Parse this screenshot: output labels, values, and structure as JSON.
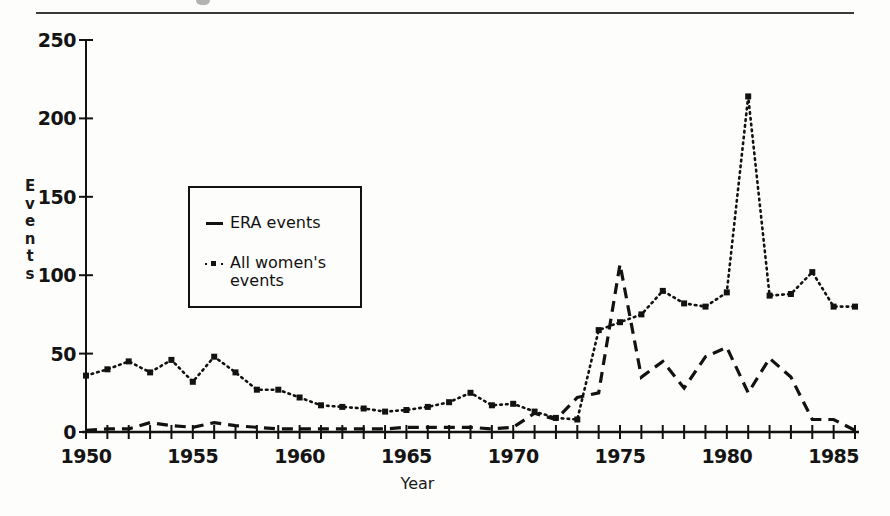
{
  "page": {
    "background_color": "#fdfdfb",
    "ink_color": "#121212",
    "top_rule": "horizontal-rule"
  },
  "axis": {
    "y_ticks": [
      "0",
      "50",
      "100",
      "150",
      "200",
      "250"
    ],
    "x_ticks": [
      "1950",
      "1955",
      "1960",
      "1965",
      "1970",
      "1975",
      "1980",
      "1985"
    ],
    "y_title_letters": [
      "E",
      "v",
      "e",
      "n",
      "t",
      "s"
    ],
    "x_title": "Year"
  },
  "legend": {
    "items": [
      {
        "label": "ERA events",
        "marker": "solid-dash-line"
      },
      {
        "label": "All women's\nevents",
        "marker": "dotted-square-line"
      }
    ]
  },
  "chart_data": {
    "type": "line",
    "title": "",
    "xlabel": "Year",
    "ylabel": "Events",
    "xlim": [
      1950,
      1986
    ],
    "ylim": [
      0,
      250
    ],
    "grid": false,
    "legend_position": "inside-left",
    "x": [
      1950,
      1951,
      1952,
      1953,
      1954,
      1955,
      1956,
      1957,
      1958,
      1959,
      1960,
      1961,
      1962,
      1963,
      1964,
      1965,
      1966,
      1967,
      1968,
      1969,
      1970,
      1971,
      1972,
      1973,
      1974,
      1975,
      1976,
      1977,
      1978,
      1979,
      1980,
      1981,
      1982,
      1983,
      1984,
      1985,
      1986
    ],
    "series": [
      {
        "name": "ERA events",
        "style": "dashed",
        "values": [
          1,
          2,
          2,
          6,
          4,
          3,
          6,
          4,
          3,
          2,
          2,
          2,
          2,
          2,
          2,
          3,
          3,
          3,
          3,
          2,
          3,
          12,
          8,
          22,
          25,
          107,
          35,
          45,
          28,
          48,
          54,
          25,
          47,
          35,
          8,
          8,
          1
        ]
      },
      {
        "name": "All women's events",
        "style": "dotted",
        "marker": "square",
        "values": [
          36,
          41,
          45,
          38,
          46,
          32,
          48,
          38,
          27,
          27,
          22,
          17,
          16,
          15,
          13,
          14,
          16,
          19,
          25,
          17,
          18,
          13,
          9,
          8,
          65,
          70,
          75,
          90,
          82,
          80,
          89,
          214,
          87,
          88,
          102,
          80,
          80
        ]
      }
    ],
    "series_note": "values read off the plot; 'All women's events' peaks at 214 in 1975 and 'ERA events' peaks at 107 in 1975"
  },
  "chart_points": {
    "era": [
      [
        1950,
        1
      ],
      [
        1951,
        2
      ],
      [
        1952,
        2
      ],
      [
        1953,
        6
      ],
      [
        1954,
        4
      ],
      [
        1955,
        3
      ],
      [
        1956,
        6
      ],
      [
        1957,
        4
      ],
      [
        1958,
        3
      ],
      [
        1959,
        2
      ],
      [
        1960,
        2
      ],
      [
        1961,
        2
      ],
      [
        1962,
        2
      ],
      [
        1963,
        2
      ],
      [
        1964,
        2
      ],
      [
        1965,
        3
      ],
      [
        1966,
        3
      ],
      [
        1967,
        3
      ],
      [
        1968,
        3
      ],
      [
        1969,
        2
      ],
      [
        1970,
        3
      ],
      [
        1971,
        12
      ],
      [
        1972,
        8
      ],
      [
        1973,
        22
      ],
      [
        1974,
        25
      ],
      [
        1975,
        107
      ],
      [
        1976,
        35
      ],
      [
        1977,
        45
      ],
      [
        1978,
        28
      ],
      [
        1979,
        48
      ],
      [
        1980,
        54
      ],
      [
        1981,
        25
      ],
      [
        1982,
        47
      ],
      [
        1983,
        35
      ],
      [
        1984,
        8
      ],
      [
        1985,
        8
      ],
      [
        1986,
        1
      ]
    ],
    "allwomen": [
      [
        1950,
        36
      ],
      [
        1951,
        40
      ],
      [
        1952,
        45
      ],
      [
        1953,
        38
      ],
      [
        1954,
        46
      ],
      [
        1955,
        32
      ],
      [
        1956,
        48
      ],
      [
        1957,
        38
      ],
      [
        1958,
        27
      ],
      [
        1959,
        27
      ],
      [
        1960,
        22
      ],
      [
        1961,
        17
      ],
      [
        1962,
        16
      ],
      [
        1963,
        15
      ],
      [
        1964,
        13
      ],
      [
        1965,
        14
      ],
      [
        1966,
        16
      ],
      [
        1967,
        19
      ],
      [
        1968,
        25
      ],
      [
        1969,
        17
      ],
      [
        1970,
        18
      ],
      [
        1971,
        13
      ],
      [
        1972,
        9
      ],
      [
        1973,
        8
      ],
      [
        1974,
        65
      ],
      [
        1975,
        70
      ],
      [
        1976,
        75
      ],
      [
        1977,
        90
      ],
      [
        1978,
        82
      ],
      [
        1979,
        80
      ],
      [
        1980,
        89
      ],
      [
        1981,
        214
      ],
      [
        1982,
        87
      ],
      [
        1983,
        88
      ],
      [
        1984,
        102
      ],
      [
        1985,
        80
      ],
      [
        1986,
        80
      ]
    ]
  }
}
